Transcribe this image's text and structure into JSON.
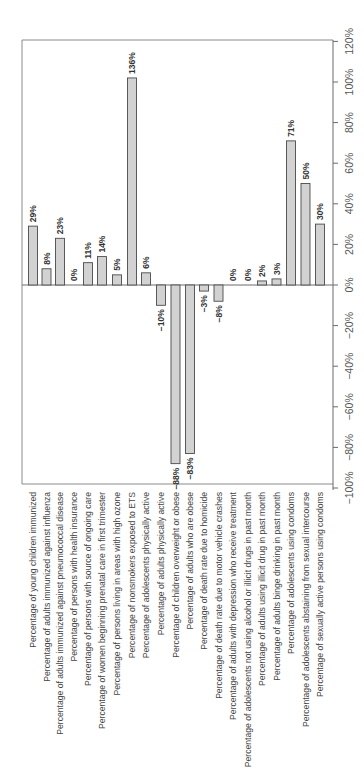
{
  "chart_data": {
    "type": "bar",
    "orientation": "rotated-90-clockwise",
    "title": "",
    "xlabel": "",
    "ylabel": "",
    "ylim": [
      -100,
      120
    ],
    "grid": false,
    "legend": null,
    "y_ticks": [
      "120%",
      "100%",
      "80%",
      "60%",
      "40%",
      "20%",
      "0%",
      "−20%",
      "−40%",
      "−60%",
      "−80%",
      "−100%"
    ],
    "y_tick_values": [
      120,
      100,
      80,
      60,
      40,
      20,
      0,
      -20,
      -40,
      -60,
      -80,
      -100
    ],
    "categories": [
      "Percentage of young children immunized",
      "Percentage of adults immunized against influenza",
      "Percentage of adults immunized against pneumococcal disease",
      "Percentage of persons with health insurance",
      "Percentage of persons with source of ongoing care",
      "Percentage of women beginning prenatal care in first trimester",
      "Percentage of persons living in areas with high ozone",
      "Percentage of nonsmokers exposed to ETS",
      "Percentage of adolescents physically active",
      "Percentage of adults physically active",
      "Percentage of children overweight or obese",
      "Percentage of adults who are obese",
      "Percentage of death rate due to homicide",
      "Percentage of death rate due to motor vehicle crashes",
      "Percentage of adults with depression who receive treatment",
      "Percentage of adolescents not using alcohol or illicit drugs in past month",
      "Percentage of adults using illicit drug in past month",
      "Percentage of adults binge drinking in past month",
      "Percentage of adolescents using condoms",
      "Percentage of adolescents abstaining from sexual intercourse",
      "Percentage of sexually active persons using condoms"
    ],
    "values": [
      29,
      8,
      23,
      0,
      11,
      14,
      5,
      136,
      6,
      -10,
      -88,
      -83,
      -3,
      -8,
      0,
      0,
      2,
      3,
      71,
      50,
      30
    ],
    "value_labels": [
      "29%",
      "8%",
      "23%",
      "0%",
      "11%",
      "14%",
      "5%",
      "136%",
      "6%",
      "−10%",
      "−88%",
      "−83%",
      "−3%",
      "−8%",
      "0%",
      "0%",
      "2%",
      "3%",
      "71%",
      "50%",
      "30%"
    ]
  },
  "colors": {
    "bar_fill": "#d2d2d2",
    "bar_stroke": "#4a4a4a",
    "axis": "#6a6a6a",
    "text": "#444444"
  }
}
